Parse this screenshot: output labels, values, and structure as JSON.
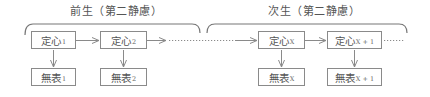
{
  "diagram": {
    "groups": [
      {
        "title": "前生（第二静慮）"
      },
      {
        "title": "次生（第二静慮）"
      }
    ],
    "nodes": {
      "top": [
        {
          "label": "定心",
          "sub": "1"
        },
        {
          "label": "定心",
          "sub": "2"
        },
        {
          "label": "定心",
          "sub": "X"
        },
        {
          "label": "定心",
          "sub": "X + 1"
        }
      ],
      "bottom": [
        {
          "label": "無表",
          "sub": "1"
        },
        {
          "label": "無表",
          "sub": "2"
        },
        {
          "label": "無表",
          "sub": "X"
        },
        {
          "label": "無表",
          "sub": "X + 1"
        }
      ]
    },
    "colors": {
      "line": "#8a8a8a",
      "text": "#555555"
    }
  }
}
